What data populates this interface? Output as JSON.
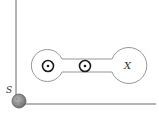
{
  "diagram": {
    "labels": {
      "sphere": "S",
      "right_chamber": "X"
    },
    "colors": {
      "line": "#555555",
      "thin_line": "#8a8a8a",
      "dot_ring": "#1a1a1a",
      "sphere_fill": "#8f8f8f",
      "sphere_edge": "#6a6a6a",
      "background": "#ffffff"
    },
    "elements": [
      {
        "type": "axis-vertical",
        "description": "vertical line"
      },
      {
        "type": "axis-horizontal",
        "description": "horizontal line"
      },
      {
        "type": "sphere",
        "label": "S"
      },
      {
        "type": "chamber-left",
        "shape": "circle"
      },
      {
        "type": "channel",
        "shape": "tube"
      },
      {
        "type": "chamber-right",
        "shape": "circle",
        "label": "X"
      },
      {
        "type": "out-of-page-symbol",
        "count": 2
      }
    ]
  }
}
